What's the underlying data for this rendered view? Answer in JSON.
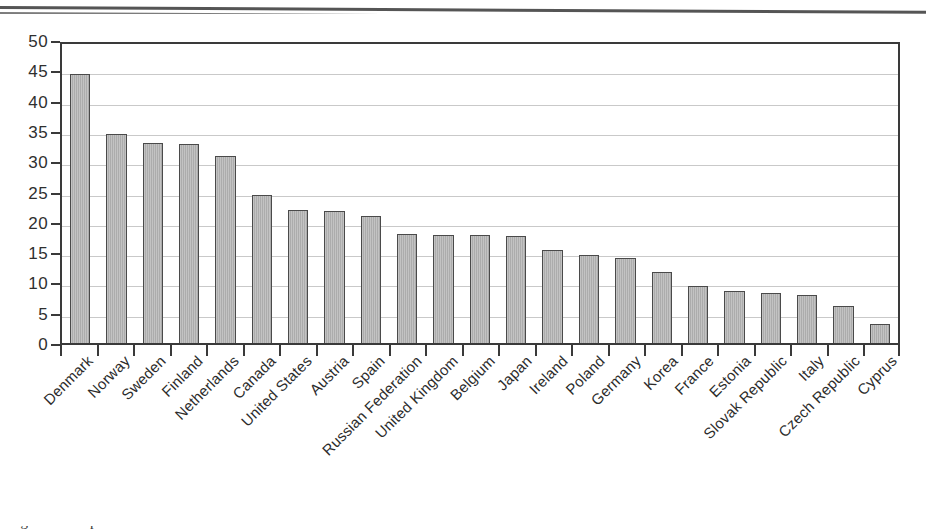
{
  "figure": {
    "caption_partial": "Figure 2.1   Expenditure on ...",
    "top_rule": "page-divider-rule"
  },
  "chart_data": {
    "type": "bar",
    "title": "",
    "subtitle": "",
    "xlabel": "",
    "ylabel": "",
    "ylim": [
      0,
      50
    ],
    "yticks": [
      0,
      5,
      10,
      15,
      20,
      25,
      30,
      35,
      40,
      45,
      50
    ],
    "ytick_labels": [
      "0",
      "5",
      "10",
      "15",
      "20",
      "25",
      "30",
      "35",
      "40",
      "45",
      "50"
    ],
    "grid": true,
    "grid_axis": "y",
    "legend": null,
    "legend_position": "none",
    "bar_color": "#b2b2b2",
    "bar_edge_color": "#4a4a4a",
    "frame_color": "#3a3a3a",
    "gridline_color": "#c9c9c9",
    "categories": [
      "Denmark",
      "Norway",
      "Sweden",
      "Finland",
      "Netherlands",
      "Canada",
      "United States",
      "Austria",
      "Spain",
      "Russian Federation",
      "United Kingdom",
      "Belgium",
      "Japan",
      "Ireland",
      "Poland",
      "Germany",
      "Korea",
      "France",
      "Estonia",
      "Slovak Republic",
      "Italy",
      "Czech Republic",
      "Cyprus"
    ],
    "values": [
      45.0,
      35.0,
      33.5,
      33.2,
      31.3,
      24.8,
      22.3,
      22.0,
      21.2,
      18.3,
      18.1,
      18.1,
      17.9,
      15.6,
      14.8,
      14.2,
      11.9,
      9.5,
      8.7,
      8.4,
      8.0,
      6.2,
      3.2
    ]
  }
}
